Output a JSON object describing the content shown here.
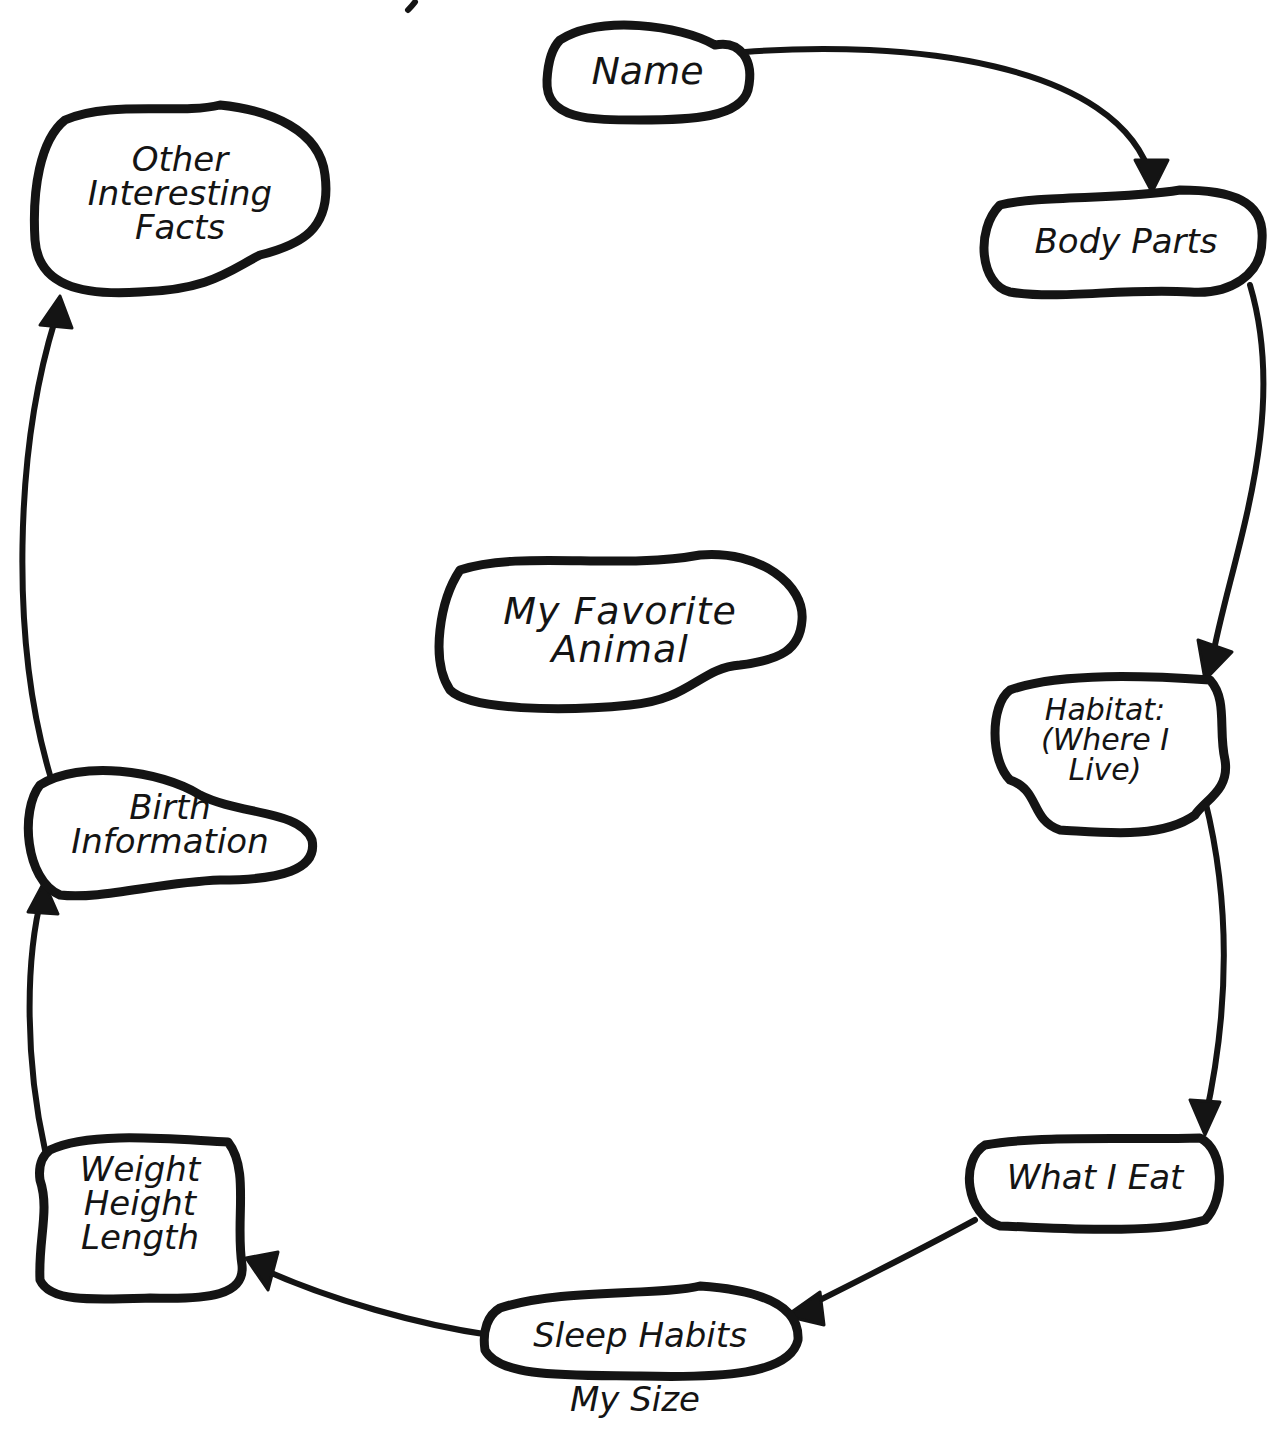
{
  "diagram": {
    "type": "cycle-web",
    "center": {
      "label": "My Favorite\nAnimal"
    },
    "nodes": [
      {
        "id": "name",
        "label": "Name"
      },
      {
        "id": "body-parts",
        "label": "Body Parts"
      },
      {
        "id": "habitat",
        "label": "Habitat:\n(Where I\nLive)"
      },
      {
        "id": "what-i-eat",
        "label": "What I Eat"
      },
      {
        "id": "sleep-habits",
        "label": "Sleep Habits"
      },
      {
        "id": "weight-height-length",
        "label": "Weight\nHeight\nLength"
      },
      {
        "id": "birth-information",
        "label": "Birth\nInformation"
      },
      {
        "id": "other-interesting-facts",
        "label": "Other\nInteresting\nFacts"
      }
    ],
    "edges": [
      {
        "from": "name",
        "to": "body-parts"
      },
      {
        "from": "body-parts",
        "to": "habitat"
      },
      {
        "from": "habitat",
        "to": "what-i-eat"
      },
      {
        "from": "what-i-eat",
        "to": "sleep-habits"
      },
      {
        "from": "sleep-habits",
        "to": "weight-height-length"
      },
      {
        "from": "weight-height-length",
        "to": "birth-information"
      },
      {
        "from": "birth-information",
        "to": "other-interesting-facts"
      }
    ],
    "annotation": "My Size",
    "colors": {
      "ink": "#141414",
      "paper": "#ffffff"
    }
  }
}
